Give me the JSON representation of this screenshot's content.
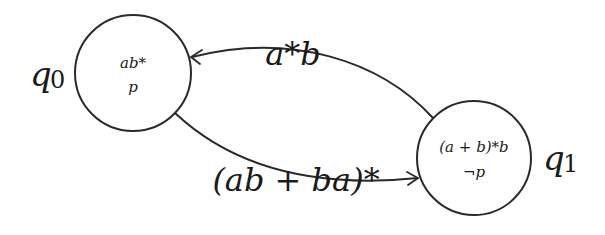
{
  "diagram": {
    "type": "automaton",
    "states": [
      {
        "id": "q0",
        "name": "q₀",
        "name_base": "q",
        "name_sub": "0",
        "expression": "ab*",
        "proposition": "p"
      },
      {
        "id": "q1",
        "name": "q₁",
        "name_base": "q",
        "name_sub": "1",
        "expression": "(a + b)*b",
        "proposition": "¬p"
      }
    ],
    "transitions": [
      {
        "from": "q1",
        "to": "q0",
        "label": "a*b"
      },
      {
        "from": "q0",
        "to": "q1",
        "label": "(ab + ba)*"
      }
    ]
  }
}
